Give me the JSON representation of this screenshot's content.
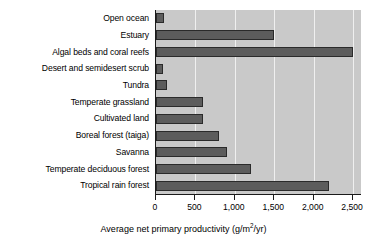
{
  "chart_data": {
    "type": "bar",
    "orientation": "horizontal",
    "title": "",
    "xlabel_prefix": "Average net primary productivity (g/m",
    "xlabel_exponent": "2",
    "xlabel_suffix": "/yr)",
    "xlabel": "Average net primary productivity (g/m2/yr)",
    "ylabel": "",
    "xlim": [
      0,
      2600
    ],
    "xticks": [
      0,
      500,
      1000,
      1500,
      2000,
      2500
    ],
    "xticklabels": [
      "0",
      "500",
      "1,000",
      "1,500",
      "2,000",
      "2,500"
    ],
    "grid": "vertical",
    "legend": "none",
    "categories": [
      "Open ocean",
      "Estuary",
      "Algal beds and coral reefs",
      "Desert and semidesert scrub",
      "Tundra",
      "Temperate grassland",
      "Cultivated land",
      "Boreal forest (taiga)",
      "Savanna",
      "Temperate deciduous forest",
      "Tropical rain forest"
    ],
    "values": [
      100,
      1500,
      2500,
      90,
      140,
      600,
      600,
      800,
      900,
      1200,
      2200
    ],
    "bar_color": "#5c5c5c",
    "bar_edge_color": "#2a2a2a",
    "plot_background": "#c9c9c9",
    "gridline_color": "#efefef",
    "axis_color": "#1a1a1a"
  }
}
